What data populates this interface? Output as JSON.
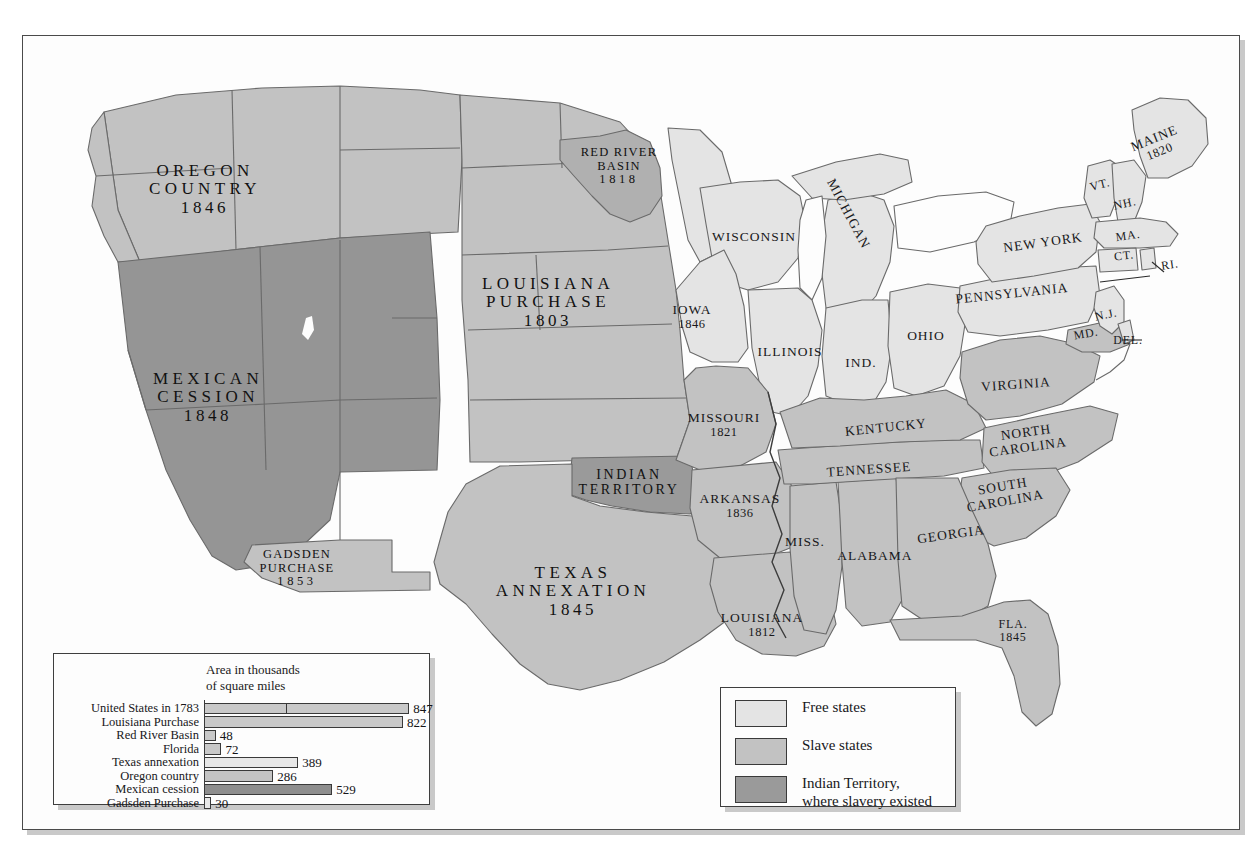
{
  "map": {
    "title": "United States Territorial Expansion",
    "colors": {
      "free_states": "#e4e4e4",
      "slave_states": "#c2c2c2",
      "indian_territory": "#9a9a9a",
      "mexican_cession": "#959595",
      "oregon_country": "#c2c2c2",
      "outline": "#6a6a6a",
      "frame": "#4a4a4a",
      "shadow": "#c9c9c9",
      "paper": "#fdfdfd",
      "text": "#18181a"
    },
    "territories": [
      {
        "id": "oregon-country",
        "name": "OREGON",
        "name2": "COUNTRY",
        "year": "1846",
        "x": 205,
        "y": 190
      },
      {
        "id": "mexican-cession",
        "name": "MEXICAN",
        "name2": "CESSION",
        "year": "1848",
        "x": 208,
        "y": 398
      },
      {
        "id": "gadsden-purchase",
        "name": "GADSDEN",
        "name2": "PURCHASE",
        "year": "1853",
        "x": 297,
        "y": 568
      },
      {
        "id": "louisiana-purchase",
        "name": "LOUISIANA",
        "name2": "PURCHASE",
        "year": "1803",
        "x": 548,
        "y": 303
      },
      {
        "id": "red-river-basin",
        "name": "RED RIVER",
        "name2": "BASIN",
        "year": "1818",
        "x": 619,
        "y": 166
      },
      {
        "id": "texas-annexation",
        "name": "TEXAS",
        "name2": "ANNEXATION",
        "year": "1845",
        "x": 573,
        "y": 592
      },
      {
        "id": "indian-territory",
        "name": "INDIAN",
        "name2": "TERRITORY",
        "year": "",
        "x": 629,
        "y": 482
      }
    ],
    "states": [
      {
        "id": "wisconsin",
        "name": "WISCONSIN",
        "year": "",
        "x": 754,
        "y": 237,
        "size": "st",
        "rot": 0
      },
      {
        "id": "michigan",
        "name": "MICHIGAN",
        "year": "",
        "x": 848,
        "y": 214,
        "size": "st",
        "rot": 62
      },
      {
        "id": "iowa",
        "name": "IOWA",
        "year": "1846",
        "x": 692,
        "y": 317,
        "size": "st",
        "rot": 0
      },
      {
        "id": "illinois",
        "name": "ILLINOIS",
        "year": "",
        "x": 790,
        "y": 352,
        "size": "st",
        "rot": 0
      },
      {
        "id": "indiana",
        "name": "IND.",
        "year": "",
        "x": 861,
        "y": 363,
        "size": "st",
        "rot": 0
      },
      {
        "id": "ohio",
        "name": "OHIO",
        "year": "",
        "x": 926,
        "y": 336,
        "size": "st",
        "rot": 0
      },
      {
        "id": "missouri",
        "name": "MISSOURI",
        "year": "1821",
        "x": 724,
        "y": 425,
        "size": "st",
        "rot": 0
      },
      {
        "id": "kentucky",
        "name": "KENTUCKY",
        "year": "",
        "x": 886,
        "y": 428,
        "size": "st",
        "rot": -6
      },
      {
        "id": "tennessee",
        "name": "TENNESSEE",
        "year": "",
        "x": 869,
        "y": 470,
        "size": "st",
        "rot": -4
      },
      {
        "id": "arkansas",
        "name": "ARKANSAS",
        "year": "1836",
        "x": 740,
        "y": 506,
        "size": "st",
        "rot": 0
      },
      {
        "id": "mississippi",
        "name": "MISS.",
        "year": "",
        "x": 805,
        "y": 542,
        "size": "st",
        "rot": 0
      },
      {
        "id": "alabama",
        "name": "ALABAMA",
        "year": "",
        "x": 875,
        "y": 556,
        "size": "st",
        "rot": 0
      },
      {
        "id": "georgia",
        "name": "GEORGIA",
        "year": "",
        "x": 951,
        "y": 535,
        "size": "st",
        "rot": -8
      },
      {
        "id": "louisiana",
        "name": "LOUISIANA",
        "year": "1812",
        "x": 762,
        "y": 625,
        "size": "st",
        "rot": 0
      },
      {
        "id": "florida",
        "name": "FLA.",
        "year": "1845",
        "x": 1013,
        "y": 631,
        "size": "st-sm",
        "rot": 0
      },
      {
        "id": "south-carolina",
        "name": "SOUTH",
        "name2": "CAROLINA",
        "year": "",
        "x": 1004,
        "y": 494,
        "size": "st",
        "rot": -10
      },
      {
        "id": "north-carolina",
        "name": "NORTH",
        "name2": "CAROLINA",
        "year": "",
        "x": 1027,
        "y": 440,
        "size": "st",
        "rot": -8
      },
      {
        "id": "virginia",
        "name": "VIRGINIA",
        "year": "",
        "x": 1016,
        "y": 385,
        "size": "st",
        "rot": -4
      },
      {
        "id": "pennsylvania",
        "name": "PENNSYLVANIA",
        "year": "",
        "x": 1012,
        "y": 294,
        "size": "st",
        "rot": -6
      },
      {
        "id": "new-york",
        "name": "NEW YORK",
        "year": "",
        "x": 1043,
        "y": 243,
        "size": "st",
        "rot": -8
      },
      {
        "id": "maine",
        "name": "MAINE",
        "year": "1820",
        "x": 1157,
        "y": 145,
        "size": "st",
        "rot": -22
      },
      {
        "id": "vermont",
        "name": "VT.",
        "year": "",
        "x": 1100,
        "y": 185,
        "size": "st-sm",
        "rot": -14
      },
      {
        "id": "new-hampshire",
        "name": "NH.",
        "year": "",
        "x": 1125,
        "y": 204,
        "size": "st-sm",
        "rot": -12
      },
      {
        "id": "massachusetts",
        "name": "MA.",
        "year": "",
        "x": 1128,
        "y": 236,
        "size": "st-sm",
        "rot": -8
      },
      {
        "id": "connecticut",
        "name": "CT.",
        "year": "",
        "x": 1124,
        "y": 256,
        "size": "st-sm",
        "rot": -6
      },
      {
        "id": "rhode-island",
        "name": "RI.",
        "year": "",
        "x": 1170,
        "y": 265,
        "size": "st-sm",
        "rot": -8
      },
      {
        "id": "new-jersey",
        "name": "N.J.",
        "year": "",
        "x": 1106,
        "y": 315,
        "size": "st-sm",
        "rot": -12
      },
      {
        "id": "maryland",
        "name": "MD.",
        "year": "",
        "x": 1086,
        "y": 334,
        "size": "st-sm",
        "rot": -10
      },
      {
        "id": "delaware",
        "name": "DEL.",
        "year": "",
        "x": 1128,
        "y": 340,
        "size": "st-sm",
        "rot": 0
      }
    ]
  },
  "chart_data": {
    "type": "bar",
    "orientation": "horizontal",
    "title": "Area in thousands",
    "title2": "of square miles",
    "xlabel": "",
    "ylabel": "",
    "xlim": [
      0,
      900
    ],
    "grid": false,
    "legend": "none",
    "categories": [
      "United States in 1783",
      "Louisiana Purchase",
      "Red River Basin",
      "Florida",
      "Texas annexation",
      "Oregon country",
      "Mexican cession",
      "Gadsden Purchase"
    ],
    "values": [
      847,
      822,
      48,
      72,
      389,
      286,
      529,
      30
    ],
    "bar_fills": [
      "#c9c9c9",
      "#c9c9c9",
      "#c9c9c9",
      "#c9c9c9",
      "#e8e8e8",
      "#c4c4c4",
      "#8e8e8e",
      "#e8e8e8"
    ]
  },
  "legend": {
    "title": "Map legend",
    "items": [
      {
        "id": "free-states",
        "label": "Free states",
        "label2": "",
        "color": "#e4e4e4"
      },
      {
        "id": "slave-states",
        "label": "Slave states",
        "label2": "",
        "color": "#c2c2c2"
      },
      {
        "id": "indian-territory",
        "label": "Indian Territory,",
        "label2": "where slavery existed",
        "color": "#9a9a9a"
      }
    ]
  }
}
